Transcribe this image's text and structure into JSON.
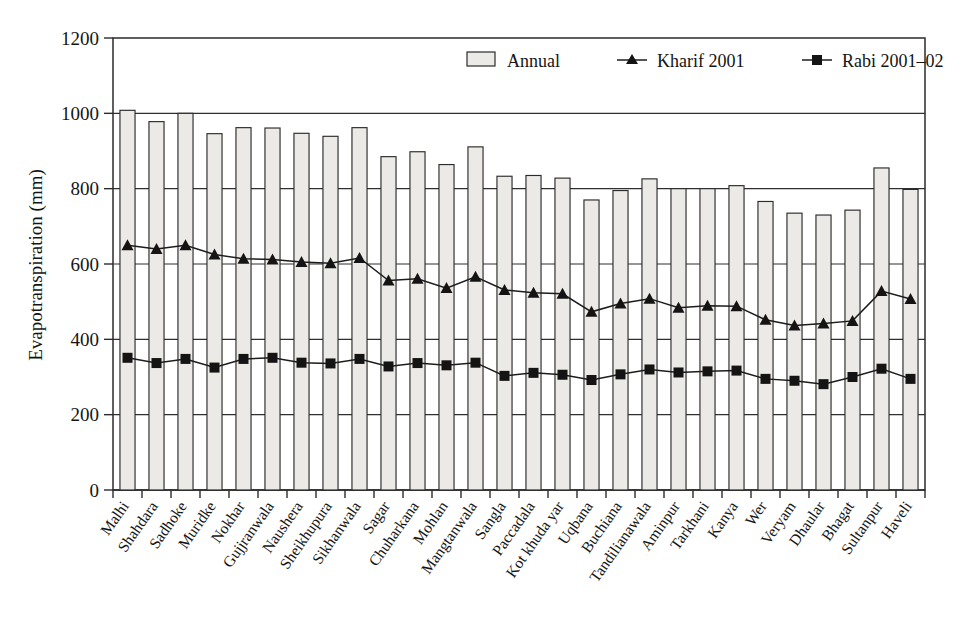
{
  "chart_data": {
    "type": "bar",
    "title": "",
    "subtitle": "",
    "xlabel": "",
    "ylabel": "Evapotranspiration (mm)",
    "ylim": [
      0,
      1200
    ],
    "ytick_step": 200,
    "yticks": [
      0,
      200,
      400,
      600,
      800,
      1000,
      1200
    ],
    "grid": "horizontal",
    "legend_position": "top-center",
    "categories": [
      "Malhi",
      "Shahdara",
      "Sadhoke",
      "Muridke",
      "Nokhar",
      "Gujjranwala",
      "Naushera",
      "Sheikhupura",
      "Sikhanwala",
      "Sagar",
      "Chuharkana",
      "Mohlan",
      "Mangtanwala",
      "Sangla",
      "Paccadala",
      "Kot khuda yar",
      "Uqbana",
      "Buchiana",
      "Tandilianawala",
      "Aminpur",
      "Tarkhani",
      "Kanya",
      "Wer",
      "Veryam",
      "Dhaular",
      "Bhagat",
      "Sultanpur",
      "Haveli"
    ],
    "series": [
      {
        "name": "Annual",
        "render": "bar",
        "values": [
          1008,
          978,
          1000,
          946,
          962,
          961,
          947,
          939,
          962,
          885,
          898,
          864,
          911,
          833,
          835,
          828,
          770,
          795,
          826,
          800,
          800,
          808,
          766,
          735,
          730,
          743,
          855,
          798
        ]
      },
      {
        "name": "Kharif 2001",
        "render": "line-marker",
        "marker": "triangle",
        "values": [
          650,
          640,
          650,
          625,
          614,
          612,
          605,
          602,
          616,
          556,
          561,
          536,
          566,
          531,
          524,
          521,
          473,
          495,
          508,
          484,
          489,
          488,
          452,
          437,
          442,
          449,
          528,
          507
        ]
      },
      {
        "name": "Rabi 2001–02",
        "render": "line-marker",
        "marker": "square",
        "values": [
          351,
          337,
          348,
          325,
          348,
          351,
          338,
          336,
          348,
          328,
          337,
          331,
          338,
          303,
          311,
          306,
          292,
          307,
          320,
          312,
          315,
          317,
          295,
          290,
          281,
          300,
          322,
          295
        ]
      }
    ]
  },
  "legend": {
    "items": [
      {
        "label": "Annual",
        "marker": "bar-swatch"
      },
      {
        "label": "Kharif 2001",
        "marker": "triangle"
      },
      {
        "label": "Rabi 2001–02",
        "marker": "square"
      }
    ]
  },
  "axes": {
    "y_title": "Evapotranspiration (mm)",
    "y_tick_labels": [
      "0",
      "200",
      "400",
      "600",
      "800",
      "1000",
      "1200"
    ]
  }
}
